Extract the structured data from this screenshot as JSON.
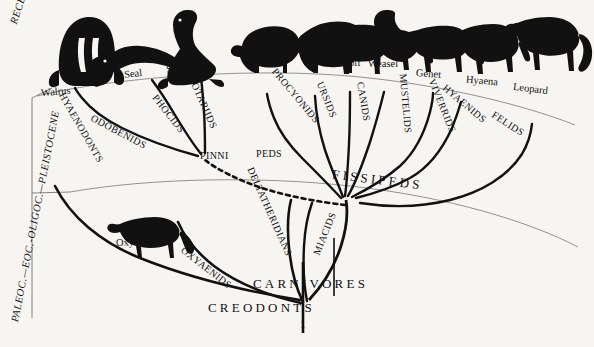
{
  "figure": {
    "type": "phylogenetic-tree",
    "background_color": "#f6f5f2",
    "ink_color": "#111111"
  },
  "time_axis": {
    "label_recent": "RECENT",
    "label_older": "PALEOC.—EOC.-OLIGOC.—PLEISTOCENE"
  },
  "animals": [
    {
      "name": "Walrus",
      "silhouette": "walrus-silhouette"
    },
    {
      "name": "Seal",
      "silhouette": "seal-silhouette"
    },
    {
      "name": "Sea Lion",
      "silhouette": "sea-lion-silhouette"
    },
    {
      "name": "Raccoon",
      "silhouette": "raccoon-silhouette"
    },
    {
      "name": "Bear",
      "silhouette": "bear-silhouette"
    },
    {
      "name": "Wolf",
      "silhouette": "wolf-silhouette"
    },
    {
      "name": "Weasel",
      "silhouette": "weasel-silhouette"
    },
    {
      "name": "Genet",
      "silhouette": "genet-silhouette"
    },
    {
      "name": "Hyaena",
      "silhouette": "hyaena-silhouette"
    },
    {
      "name": "Leopard",
      "silhouette": "leopard-silhouette"
    }
  ],
  "families": [
    {
      "name": "ODOBENIDS"
    },
    {
      "name": "PHOCIDS"
    },
    {
      "name": "OTARIIDS"
    },
    {
      "name": "PROCYONIDS"
    },
    {
      "name": "URSIDS"
    },
    {
      "name": "CANIDS"
    },
    {
      "name": "MUSTELIDS"
    },
    {
      "name": "VIVERRIDS"
    },
    {
      "name": "HYAENIDS"
    },
    {
      "name": "FELIDS"
    }
  ],
  "groups": {
    "pinnipeds_left": "PINNI",
    "pinnipeds_right": "PEDS",
    "fissipeds": "FISSIPEDS",
    "carnivores": "CARNIVORES",
    "creodonts": "CREODONTS",
    "miacids": "MIACIDS",
    "hyaenodonts": "HYAENODONTS",
    "oxyaenids": "OXYAENIDS",
    "deltatheridians": "DELTATHERIDIANS"
  },
  "fossil_genus": {
    "name": "Oxyaena",
    "silhouette": "oxyaena-silhouette"
  },
  "root_tick": "1"
}
